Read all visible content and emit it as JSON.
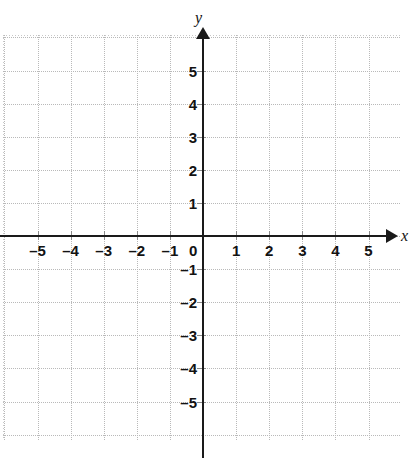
{
  "chart_data": {
    "type": "scatter",
    "title": "",
    "subtitle": "",
    "xlabel": "x",
    "ylabel": "y",
    "xlim": [
      -5.5,
      5.5
    ],
    "ylim": [
      -5.5,
      5.5
    ],
    "xticks": [
      -5,
      -4,
      -3,
      -2,
      -1,
      0,
      1,
      2,
      3,
      4,
      5
    ],
    "yticks": [
      5,
      4,
      3,
      2,
      1,
      -1,
      -2,
      -3,
      -4,
      -5
    ],
    "xtick_labels": [
      "–5",
      "–4",
      "–3",
      "–2",
      "–1",
      "0",
      "1",
      "2",
      "3",
      "4",
      "5"
    ],
    "ytick_labels": [
      "5",
      "4",
      "3",
      "2",
      "1",
      "–1",
      "–2",
      "–3",
      "–4",
      "–5"
    ],
    "grid": true,
    "grid_style": "dotted",
    "legend": false,
    "series": [],
    "values": [],
    "x": [],
    "annotations": [],
    "origin_label": "0"
  },
  "plot": {
    "axis_x_name": "x",
    "axis_y_name": "y",
    "origin_label": "0",
    "x_labels": [
      {
        "value": -5,
        "text": "–5"
      },
      {
        "value": -4,
        "text": "–4"
      },
      {
        "value": -3,
        "text": "–3"
      },
      {
        "value": -2,
        "text": "–2"
      },
      {
        "value": -1,
        "text": "–1"
      },
      {
        "value": 1,
        "text": "1"
      },
      {
        "value": 2,
        "text": "2"
      },
      {
        "value": 3,
        "text": "3"
      },
      {
        "value": 4,
        "text": "4"
      },
      {
        "value": 5,
        "text": "5"
      }
    ],
    "y_labels": [
      {
        "value": 5,
        "text": "5"
      },
      {
        "value": 4,
        "text": "4"
      },
      {
        "value": 3,
        "text": "3"
      },
      {
        "value": 2,
        "text": "2"
      },
      {
        "value": 1,
        "text": "1"
      },
      {
        "value": -1,
        "text": "–1"
      },
      {
        "value": -2,
        "text": "–2"
      },
      {
        "value": -3,
        "text": "–3"
      },
      {
        "value": -4,
        "text": "–4"
      },
      {
        "value": -5,
        "text": "–5"
      }
    ]
  },
  "colors": {
    "background": "#ffffff",
    "axis": "#1a1a1a",
    "gridline": "#b9b9b9",
    "label": "#121212"
  }
}
